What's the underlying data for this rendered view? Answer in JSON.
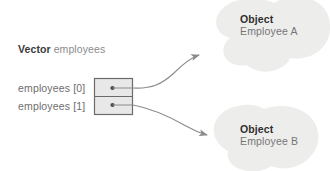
{
  "diagram": {
    "title_absent": true,
    "background_color": "#ffffff",
    "vector_label": {
      "keyword": "Vector",
      "name": "employees"
    },
    "array": {
      "fill_color": "#e8e8e8",
      "border_color": "#6b6b6b",
      "cells": [
        {
          "label": "employees [0]",
          "pointer_dot": "pointer-dot",
          "target": "Employee A"
        },
        {
          "label": "employees [1]",
          "pointer_dot": "pointer-dot",
          "target": "Employee B"
        }
      ]
    },
    "objects": [
      {
        "kind": "Object",
        "name": "Employee A",
        "blob_color": "#ededec"
      },
      {
        "kind": "Object",
        "name": "Employee B",
        "blob_color": "#ededec"
      }
    ],
    "arrows": [
      {
        "name": "arrow-cell0-to-employee-a",
        "from": "employees [0]",
        "to": "Employee A",
        "color": "#808080"
      },
      {
        "name": "arrow-cell1-to-employee-b",
        "from": "employees [1]",
        "to": "Employee B",
        "color": "#808080"
      }
    ]
  }
}
